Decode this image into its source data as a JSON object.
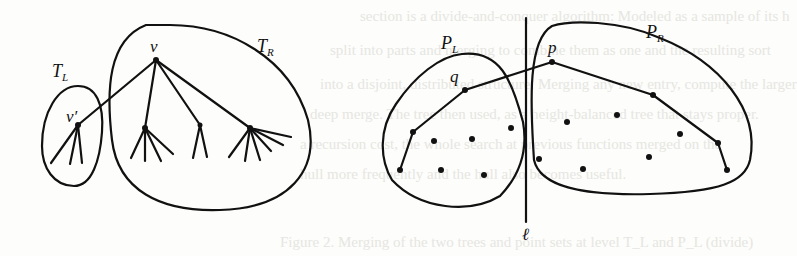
{
  "figure": {
    "left_panel": {
      "labels": {
        "root": "ν",
        "child": "ν′",
        "left_tree": "T",
        "left_tree_sub": "L",
        "right_tree": "T",
        "right_tree_sub": "R"
      }
    },
    "right_panel": {
      "labels": {
        "left_set": "P",
        "left_set_sub": "L",
        "right_set": "P",
        "right_set_sub": "R",
        "left_point": "q",
        "right_point": "p",
        "dividing_line": "ℓ"
      }
    },
    "stroke_color": "#111111",
    "background_color": "#fdfdfb"
  },
  "ghost_text": {
    "lines": [
      "section is a divide-and-conquer algorithm: Modeled as a sample of its h",
      "split into parts and merging to combine them as one and the resulting sort",
      "into a disjoint, distributed structure. Merging any new entry, compute the larger",
      "deep merge. The tree then used, as a height-balanced tree that stays proper.",
      "a recursion cost, the whole search at previous functions merged on the",
      "hull more frequently and the hull also becomes useful.",
      "Figure 2. Merging of the two trees and point sets at level T_L and P_L (divide)"
    ]
  }
}
